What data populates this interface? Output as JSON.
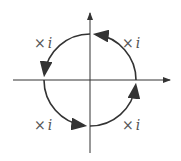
{
  "diagram": {
    "title": "",
    "axes": {
      "horizontal": {
        "x1": 13,
        "x2": 170,
        "y": 80,
        "arrow": "right"
      },
      "vertical": {
        "x": 90,
        "y1": 153,
        "y2": 13,
        "arrow": "up"
      }
    },
    "circle": {
      "cx": 90,
      "cy": 80,
      "r": 46,
      "direction": "counterclockwise"
    },
    "labels": [
      {
        "text": "×",
        "var": "i",
        "x": 122,
        "y": 48,
        "quadrant": "upper-right"
      },
      {
        "text": "×",
        "var": "i",
        "x": 34,
        "y": 48,
        "quadrant": "upper-left"
      },
      {
        "text": "×",
        "var": "i",
        "x": 34,
        "y": 130,
        "quadrant": "lower-left"
      },
      {
        "text": "×",
        "var": "i",
        "x": 122,
        "y": 130,
        "quadrant": "lower-right"
      }
    ],
    "colors": {
      "stroke": "#333333",
      "label": "#555555"
    }
  }
}
